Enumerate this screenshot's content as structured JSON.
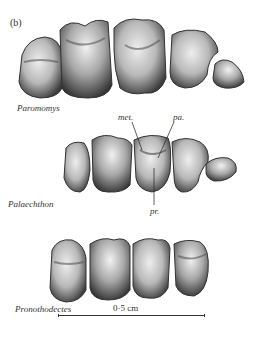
{
  "figure": {
    "panel_label": "(b)",
    "rows": [
      {
        "taxon": "Paromomys",
        "tooth_count": 5
      },
      {
        "taxon": "Palaechthon",
        "tooth_count": 5,
        "annotations": [
          {
            "label": "met.",
            "meaning": "metacone"
          },
          {
            "label": "pa.",
            "meaning": "paracone"
          },
          {
            "label": "pr.",
            "meaning": "protocone"
          }
        ]
      },
      {
        "taxon": "Pronothodectes",
        "tooth_count": 4
      }
    ],
    "scale_bar": {
      "label": "0·5 cm"
    }
  },
  "colors": {
    "background": "#ffffff",
    "enamel_light": "#e6e6e6",
    "enamel_mid": "#9a9a9a",
    "enamel_dark": "#3a3a3a",
    "text": "#333333"
  }
}
